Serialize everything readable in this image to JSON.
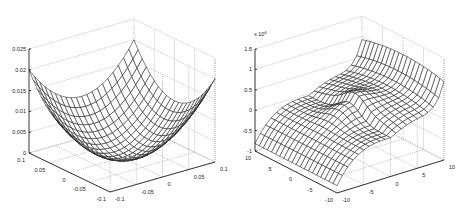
{
  "chart_data": [
    {
      "type": "surface",
      "title": "",
      "function": "z = x^2 + y^2",
      "xlabel": "",
      "ylabel": "",
      "zlabel": "",
      "x_range": [
        -0.1,
        0.1
      ],
      "y_range": [
        -0.1,
        0.1
      ],
      "z_range": [
        0,
        0.025
      ],
      "x_ticks": [
        "-0.1",
        "-0.05",
        "0",
        "0.05",
        "0.1"
      ],
      "y_ticks": [
        "-0.1",
        "-0.05",
        "0",
        "0.05",
        "0.1"
      ],
      "z_ticks": [
        "0",
        "0.005",
        "0.01",
        "0.015",
        "0.02",
        "0.025"
      ],
      "grid": true,
      "mesh_resolution": 21
    },
    {
      "type": "surface",
      "title": "",
      "function": "z = x^6 + y^6 - ... (saddle-like sextic, scaled x10^6)",
      "xlabel": "",
      "ylabel": "",
      "zlabel": "",
      "x_range": [
        -10,
        10
      ],
      "y_range": [
        -10,
        10
      ],
      "z_range": [
        -1,
        1.5
      ],
      "z_multiplier": "x 10^6",
      "x_ticks": [
        "-10",
        "-5",
        "0",
        "5",
        "10"
      ],
      "y_ticks": [
        "-10",
        "-5",
        "0",
        "5",
        "10"
      ],
      "z_ticks": [
        "-1",
        "-0.5",
        "0",
        "0.5",
        "1",
        "1.5"
      ],
      "grid": true,
      "mesh_resolution": 21
    }
  ],
  "left": {
    "z_ticks": [
      "0.025",
      "0.02",
      "0.015",
      "0.01",
      "0.005",
      "0"
    ],
    "y_ticks_leftaxis": [
      "0.1",
      "0.05",
      "0",
      "-0.05",
      "-0.1"
    ],
    "x_ticks_rightaxis": [
      "-0.1",
      "-0.05",
      "0",
      "0.05",
      "0.1"
    ]
  },
  "right": {
    "multiplier": "x 10",
    "multiplier_exp": "6",
    "z_ticks": [
      "1.5",
      "1",
      "0.5",
      "0",
      "-0.5",
      "-1"
    ],
    "y_ticks_leftaxis": [
      "10",
      "5",
      "0",
      "-5",
      "-10"
    ],
    "x_ticks_rightaxis": [
      "-10",
      "-5",
      "0",
      "5",
      "10"
    ]
  }
}
